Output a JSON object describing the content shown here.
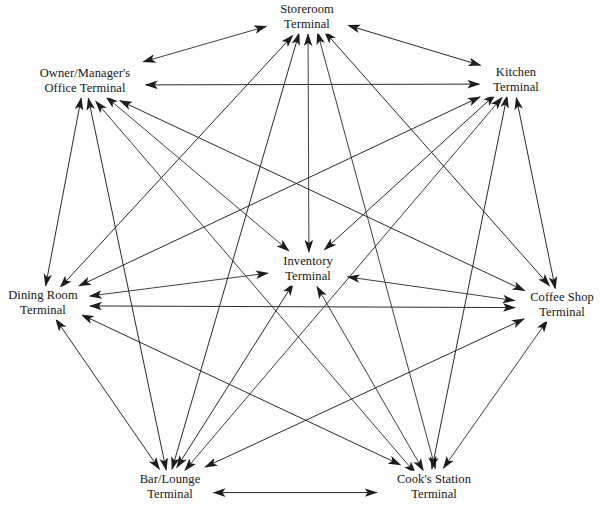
{
  "diagram": {
    "type": "fully-connected-mesh",
    "background_color": "#fefefe",
    "line_color": "#2b2b2b",
    "text_color": "#151515",
    "arrow_style": "double-headed",
    "canvas": {
      "width": 600,
      "height": 514
    },
    "nodes": [
      {
        "id": "storeroom",
        "line1": "Storeroom",
        "line2": "Terminal",
        "x": 307,
        "y": 17,
        "role": "perimeter"
      },
      {
        "id": "kitchen",
        "line1": "Kitchen",
        "line2": "Terminal",
        "x": 516,
        "y": 80,
        "role": "perimeter"
      },
      {
        "id": "coffee",
        "line1": "Coffee Shop",
        "line2": "Terminal",
        "x": 562,
        "y": 305,
        "role": "perimeter"
      },
      {
        "id": "cooks",
        "line1": "Cook's Station",
        "line2": "Terminal",
        "x": 434,
        "y": 487,
        "role": "perimeter"
      },
      {
        "id": "bar",
        "line1": "Bar/Lounge",
        "line2": "Terminal",
        "x": 170,
        "y": 487,
        "role": "perimeter"
      },
      {
        "id": "dining",
        "line1": "Dining Room",
        "line2": "Terminal",
        "x": 43,
        "y": 303,
        "role": "perimeter"
      },
      {
        "id": "owner",
        "line1": "Owner/Manager's",
        "line2": "Office Terminal",
        "x": 85,
        "y": 81,
        "role": "perimeter"
      },
      {
        "id": "inventory",
        "line1": "Inventory",
        "line2": "Terminal",
        "x": 308,
        "y": 269,
        "role": "hub"
      }
    ],
    "edges": [
      {
        "from": "owner",
        "to": "storeroom",
        "bidirectional": true
      },
      {
        "from": "owner",
        "to": "kitchen",
        "bidirectional": true
      },
      {
        "from": "owner",
        "to": "coffee",
        "bidirectional": true
      },
      {
        "from": "owner",
        "to": "cooks",
        "bidirectional": true
      },
      {
        "from": "owner",
        "to": "bar",
        "bidirectional": true
      },
      {
        "from": "owner",
        "to": "dining",
        "bidirectional": true
      },
      {
        "from": "owner",
        "to": "inventory",
        "bidirectional": true
      },
      {
        "from": "storeroom",
        "to": "kitchen",
        "bidirectional": true
      },
      {
        "from": "storeroom",
        "to": "coffee",
        "bidirectional": true
      },
      {
        "from": "storeroom",
        "to": "cooks",
        "bidirectional": true
      },
      {
        "from": "storeroom",
        "to": "bar",
        "bidirectional": true
      },
      {
        "from": "storeroom",
        "to": "dining",
        "bidirectional": true
      },
      {
        "from": "storeroom",
        "to": "inventory",
        "bidirectional": true
      },
      {
        "from": "kitchen",
        "to": "coffee",
        "bidirectional": true
      },
      {
        "from": "kitchen",
        "to": "cooks",
        "bidirectional": true
      },
      {
        "from": "kitchen",
        "to": "bar",
        "bidirectional": true
      },
      {
        "from": "kitchen",
        "to": "dining",
        "bidirectional": true
      },
      {
        "from": "kitchen",
        "to": "inventory",
        "bidirectional": true
      },
      {
        "from": "coffee",
        "to": "cooks",
        "bidirectional": true
      },
      {
        "from": "coffee",
        "to": "bar",
        "bidirectional": true
      },
      {
        "from": "coffee",
        "to": "dining",
        "bidirectional": true
      },
      {
        "from": "coffee",
        "to": "inventory",
        "bidirectional": true
      },
      {
        "from": "cooks",
        "to": "bar",
        "bidirectional": true
      },
      {
        "from": "cooks",
        "to": "dining",
        "bidirectional": true
      },
      {
        "from": "cooks",
        "to": "inventory",
        "bidirectional": true
      },
      {
        "from": "bar",
        "to": "dining",
        "bidirectional": true
      },
      {
        "from": "bar",
        "to": "inventory",
        "bidirectional": true
      },
      {
        "from": "dining",
        "to": "inventory",
        "bidirectional": true
      }
    ]
  }
}
